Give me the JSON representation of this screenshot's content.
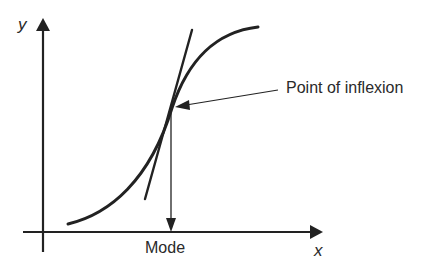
{
  "diagram": {
    "axes": {
      "y_label": "y",
      "x_label": "x"
    },
    "annotations": {
      "inflexion_label": "Point of inflexion",
      "mode_label": "Mode"
    },
    "elements": [
      {
        "name": "s-shaped-curve",
        "type": "curve"
      },
      {
        "name": "tangent-line",
        "type": "line",
        "note": "tangent at point of inflexion"
      },
      {
        "name": "mode-arrow",
        "type": "arrow",
        "note": "vertical from inflexion point down to x-axis"
      },
      {
        "name": "inflexion-pointer",
        "type": "arrow",
        "note": "from label to inflexion point"
      }
    ],
    "colors": {
      "ink": "#222222",
      "background": "#ffffff"
    }
  }
}
